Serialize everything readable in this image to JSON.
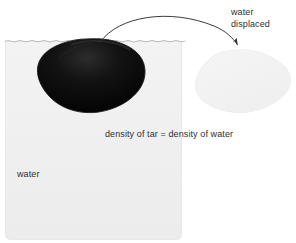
{
  "figure": {
    "title_text": "",
    "background_color": "#ffffff"
  },
  "labels": {
    "displaced_line1": "water",
    "displaced_line2": "displaced",
    "density_equation": "density of tar = density of water",
    "water_body": "water"
  },
  "elements": {
    "water_body": {
      "name": "water",
      "fill_color": "#efefef",
      "edge_color": "#e2e2e2"
    },
    "tar_blob": {
      "name": "tar",
      "fill_color": "#0a0a0a",
      "edge_color": "#2a2a2a"
    },
    "displaced_water_blob": {
      "name": "water displaced",
      "fill_color": "#f2f2f2",
      "edge_color": "#ebebeb"
    },
    "water_surface_line": {
      "name": "water surface",
      "color": "#b8b8b8",
      "style": "wavy-dashed"
    },
    "arrow": {
      "name": "displacement arrow",
      "color": "#303030",
      "direction": "tar-to-displaced-water"
    }
  },
  "colors": {
    "text": "#303030",
    "water": "#efefef",
    "tar": "#0a0a0a",
    "displaced": "#f2f2f2",
    "surface": "#b8b8b8",
    "arrow": "#303030"
  }
}
